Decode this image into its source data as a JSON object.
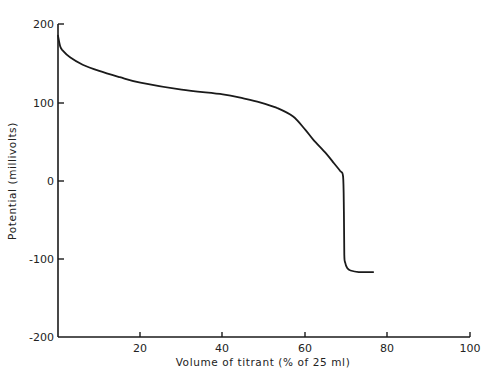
{
  "chart_data": {
    "type": "line",
    "title": "",
    "xlabel": "Volume of titrant (% of 25 ml)",
    "ylabel": "Potential (millivolts)",
    "xlim": [
      0,
      100
    ],
    "ylim": [
      -200,
      200
    ],
    "x_ticks": [
      20,
      40,
      60,
      80,
      100
    ],
    "x_tick_labels": [
      "20",
      "40",
      "60",
      "80",
      "100"
    ],
    "y_ticks": [
      200,
      100,
      0,
      -100,
      -200
    ],
    "y_tick_labels": [
      "200",
      "100",
      "0",
      "-100",
      "-200"
    ],
    "grid": false,
    "legend": null,
    "series": [
      {
        "name": "Titration curve",
        "x": [
          0,
          0.5,
          1,
          3,
          6,
          10,
          15,
          20,
          30,
          40,
          45,
          49,
          53,
          57,
          60,
          62,
          65,
          67,
          68.5,
          69.2,
          69.4,
          69.5,
          69.7,
          70.2,
          71,
          73,
          76.5
        ],
        "y": [
          185,
          172,
          167,
          157,
          148,
          140,
          132,
          125,
          116,
          110,
          105,
          100,
          93,
          82,
          65,
          52,
          35,
          22,
          12,
          5,
          -40,
          -95,
          -105,
          -112,
          -115,
          -117,
          -117
        ]
      }
    ]
  },
  "labels": {
    "x_axis_title": "Volume of titrant (% of 25 ml)",
    "y_axis_title": "Potential (millivolts)",
    "y_tick_200": "200",
    "y_tick_100": "100",
    "y_tick_0": "0",
    "y_tick_m100": "-100",
    "y_tick_m200": "-200",
    "x_tick_20": "20",
    "x_tick_40": "40",
    "x_tick_60": "60",
    "x_tick_80": "80",
    "x_tick_100": "100"
  },
  "colors": {
    "line": "#1a1a1a",
    "axis": "#1a1a1a",
    "background": "#ffffff"
  }
}
